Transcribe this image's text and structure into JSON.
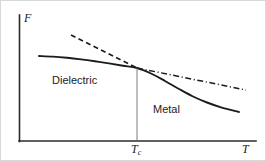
{
  "figure": {
    "background_color": "#ffffff",
    "frame_color": "#d8d8d8",
    "ink_color": "#1c1c1c",
    "marker_color": "#6e6e6e",
    "width": 266,
    "height": 161
  },
  "axes": {
    "y_label": "F",
    "x_label": "T",
    "tick_label": "T",
    "tick_subscript": "c",
    "y_axis_x": 18,
    "y_axis_top": 14,
    "x_axis_y": 140,
    "x_axis_right": 255
  },
  "regions": {
    "left_label": "Dielectric",
    "right_label": "Metal"
  },
  "chart_data": {
    "type": "line",
    "title": "",
    "xlabel": "T",
    "ylabel": "F",
    "grid": false,
    "legend": "none",
    "axis_ticks": {
      "x": [
        {
          "label": "T_c",
          "display": "Tc",
          "pixel_x": 136
        }
      ],
      "y": []
    },
    "annotations": [
      {
        "text": "Dielectric",
        "pixel_x": 51,
        "pixel_y": 74
      },
      {
        "text": "Metal",
        "pixel_x": 152,
        "pixel_y": 103
      }
    ],
    "axis_ranges": {
      "x_pixels": [
        18,
        255
      ],
      "y_pixels": [
        140,
        14
      ]
    },
    "transition_point": {
      "pixel_x": 136,
      "pixel_y": 67
    },
    "series": [
      {
        "name": "equilibrium free energy",
        "style": "solid",
        "description": "lower envelope: dielectric branch below Tc, metal branch above Tc",
        "points": [
          [
            38,
            55
          ],
          [
            52,
            55.6
          ],
          [
            66,
            56.8
          ],
          [
            80,
            58.4
          ],
          [
            94,
            60.3
          ],
          [
            108,
            62.4
          ],
          [
            122,
            64.7
          ],
          [
            136,
            67
          ],
          [
            150,
            72.5
          ],
          [
            164,
            80
          ],
          [
            178,
            88
          ],
          [
            192,
            95.5
          ],
          [
            206,
            101.5
          ],
          [
            220,
            106.3
          ],
          [
            238,
            111
          ]
        ]
      },
      {
        "name": "metal branch (metastable below Tc)",
        "style": "dashed",
        "description": "steep dashed line extrapolated to temperatures below Tc",
        "points": [
          [
            70,
            34
          ],
          [
            136,
            67
          ]
        ]
      },
      {
        "name": "dielectric branch (metastable above Tc)",
        "style": "dash-dot",
        "description": "shallow dash-dot line extrapolated to temperatures above Tc",
        "points": [
          [
            136,
            67
          ],
          [
            245,
            89
          ]
        ]
      },
      {
        "name": "critical temperature marker",
        "style": "thin-vertical",
        "description": "vertical guide line dropped from the crossing point to the T axis",
        "points": [
          [
            136,
            67
          ],
          [
            136,
            140
          ]
        ]
      }
    ]
  }
}
